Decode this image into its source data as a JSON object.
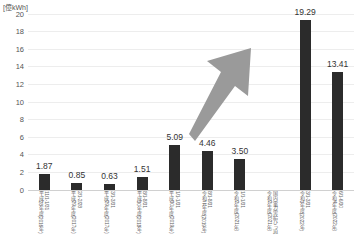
{
  "chart_data": {
    "type": "bar",
    "title": "",
    "subtitle": "",
    "unit_caption": "[億kWh]",
    "xlabel": "",
    "ylabel": "",
    "ylim": [
      0,
      20
    ],
    "ytick_step": 2,
    "yticks": [
      "0",
      "2",
      "4",
      "6",
      "8",
      "10",
      "12",
      "14",
      "16",
      "18",
      "20"
    ],
    "grid": true,
    "legend": "none",
    "bar_color": "#2b2b2b",
    "gridline_color": "#ededed",
    "axis_color": "#d0d0d0",
    "categories": [
      "平成28年度(2016年)11/1-1/31",
      "平成29年度(2017年)2/1-2/28",
      "平成29年度(2017年)3/1-3/31",
      "平成30年度(2018年)8/1-8/31",
      "平成30年度(2019年)1/1-1/31",
      "令和元年度(2019年)8/1-8/31",
      "令和2年度(2021年)1/1-1/31",
      "令和2年度(2021年)国内電力需給ひっ迫",
      "令和3年度(2022年)3/1-3/31",
      "令和4年度(2022年)6/1-6/30"
    ],
    "values": [
      1.87,
      0.85,
      0.63,
      1.51,
      5.09,
      4.46,
      3.5,
      null,
      19.29,
      13.41
    ],
    "value_labels": [
      "1.87",
      "0.85",
      "0.63",
      "1.51",
      "5.09",
      "4.46",
      "3.50",
      "",
      "19.29",
      "13.41"
    ],
    "annotations": [
      {
        "name": "upward-trend-arrow",
        "type": "arrow",
        "color": "#9a9a9a",
        "direction": "up-right"
      }
    ],
    "category_labels": [
      {
        "main": "平成28年度",
        "sub": "(2016年)",
        "range": "11/1-1/31"
      },
      {
        "main": "平成29年度",
        "sub": "(2017年)",
        "range": "2/1-2/28"
      },
      {
        "main": "平成29年度",
        "sub": "(2017年)",
        "range": "3/1-3/31"
      },
      {
        "main": "平成30年度",
        "sub": "(2018年)",
        "range": "8/1-8/31"
      },
      {
        "main": "平成30年度",
        "sub": "(2019年)",
        "range": "1/1-1/31"
      },
      {
        "main": "令和元年度",
        "sub": "(2019年)",
        "range": "8/1-8/31"
      },
      {
        "main": "令和2年度",
        "sub": "(2021年)",
        "range": "1/1-1/31"
      },
      {
        "main": "令和2年度",
        "sub": "(2021年)",
        "range": "国内電力需給ひっ迫"
      },
      {
        "main": "令和3年度",
        "sub": "(2022年)",
        "range": "3/1-3/31"
      },
      {
        "main": "令和4年度",
        "sub": "(2022年)",
        "range": "6/1-6/30"
      }
    ]
  }
}
